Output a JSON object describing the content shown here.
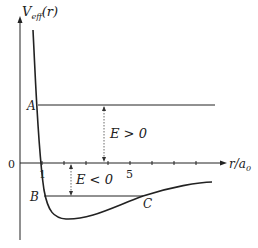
{
  "diagram": {
    "y_axis": {
      "label_main": "V",
      "label_sub": "eff",
      "label_arg": "(r)"
    },
    "x_axis": {
      "label": "r/a",
      "label_sub": "0"
    },
    "origin_label": "0",
    "tick_labels": [
      "1",
      "5"
    ],
    "points": {
      "A": "A",
      "B": "B",
      "C": "C"
    },
    "energy_labels": {
      "positive": "E > 0",
      "negative": "E < 0"
    },
    "colors": {
      "line": "#222222",
      "dotted": "#444444",
      "background": "#ffffff"
    }
  }
}
